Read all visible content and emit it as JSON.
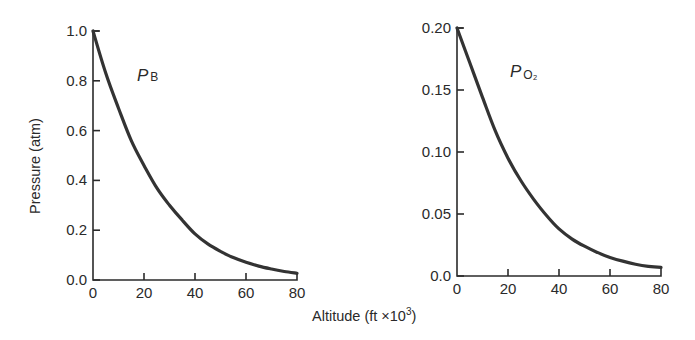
{
  "figure": {
    "shared_xlabel": "Altitude (ft ×10",
    "shared_xlabel_sup": "3",
    "shared_xlabel_close": ")",
    "shared_ylabel": "Pressure (atm)"
  },
  "chart_data": [
    {
      "type": "line",
      "title": "",
      "series_label": "P",
      "series_label_sub": "B",
      "xlabel": "Altitude (ft ×10³)",
      "ylabel": "Pressure (atm)",
      "xlim": [
        0,
        80
      ],
      "ylim": [
        0.0,
        1.0
      ],
      "x_ticks": [
        "0",
        "20",
        "40",
        "60",
        "80"
      ],
      "y_ticks": [
        "0.0",
        "0.2",
        "0.4",
        "0.6",
        "0.8",
        "1.0"
      ],
      "grid": false,
      "color": "#333333",
      "x": [
        0,
        5,
        10,
        15,
        20,
        25,
        30,
        35,
        40,
        45,
        50,
        55,
        60,
        65,
        70,
        75,
        80
      ],
      "values": [
        1.0,
        0.83,
        0.69,
        0.56,
        0.46,
        0.37,
        0.3,
        0.24,
        0.185,
        0.145,
        0.115,
        0.09,
        0.071,
        0.056,
        0.044,
        0.034,
        0.027
      ]
    },
    {
      "type": "line",
      "title": "",
      "series_label": "P",
      "series_label_sub": "O₂",
      "xlabel": "Altitude (ft ×10³)",
      "ylabel": "",
      "xlim": [
        0,
        80
      ],
      "ylim": [
        0.0,
        0.2
      ],
      "x_ticks": [
        "0",
        "20",
        "40",
        "60",
        "80"
      ],
      "y_ticks": [
        "0.0",
        "0.05",
        "0.10",
        "0.15",
        "0.20"
      ],
      "grid": false,
      "color": "#333333",
      "x": [
        0,
        5,
        10,
        15,
        20,
        25,
        30,
        35,
        40,
        45,
        50,
        55,
        60,
        65,
        70,
        75,
        80
      ],
      "values": [
        0.2,
        0.172,
        0.144,
        0.117,
        0.095,
        0.077,
        0.062,
        0.049,
        0.038,
        0.03,
        0.024,
        0.019,
        0.015,
        0.012,
        0.0095,
        0.0078,
        0.007
      ]
    }
  ]
}
